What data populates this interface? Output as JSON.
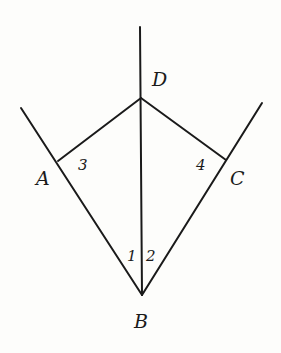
{
  "diagram": {
    "points": {
      "D": {
        "label": "D",
        "x": 141,
        "y": 98
      },
      "A": {
        "label": "A",
        "x": 58,
        "y": 161
      },
      "C": {
        "label": "C",
        "x": 226,
        "y": 160
      },
      "B": {
        "label": "B",
        "x": 142,
        "y": 295
      }
    },
    "angles": [
      {
        "label": "3",
        "at": "A"
      },
      {
        "label": "4",
        "at": "C"
      },
      {
        "label": "1",
        "at": "B",
        "side": "left"
      },
      {
        "label": "2",
        "at": "B",
        "side": "right"
      }
    ],
    "segments": [
      "BD (extended above D)",
      "DA",
      "DC",
      "BA (extended beyond A)",
      "BC (extended beyond C)"
    ],
    "stroke_color": "#1a1a1a",
    "background": "#fdfdfb"
  }
}
